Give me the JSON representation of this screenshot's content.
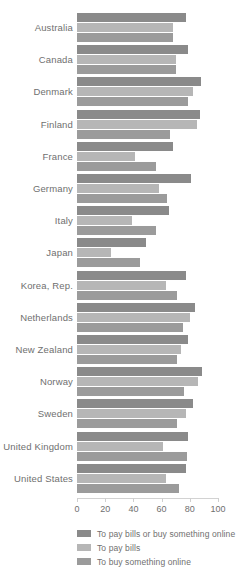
{
  "chart_data": {
    "type": "bar",
    "orientation": "horizontal",
    "title": "",
    "subtitle": "",
    "xlabel": "",
    "ylabel": "",
    "xlim": [
      0,
      100
    ],
    "xticks": [
      0,
      20,
      40,
      60,
      80,
      100
    ],
    "xtick_labels": [
      "0",
      "20",
      "40",
      "60",
      "80",
      "100"
    ],
    "grid": false,
    "legend_position": "bottom-left",
    "categories": [
      "Australia",
      "Canada",
      "Denmark",
      "Finland",
      "France",
      "Germany",
      "Italy",
      "Japan",
      "Korea, Rep.",
      "Netherlands",
      "New Zealand",
      "Norway",
      "Sweden",
      "United Kingdom",
      "United States"
    ],
    "series": [
      {
        "name": "To pay bills or buy something online",
        "color": "#8a8a8a",
        "values": [
          77,
          79,
          88,
          87,
          68,
          81,
          65,
          49,
          77,
          84,
          79,
          89,
          82,
          79,
          77
        ]
      },
      {
        "name": "To pay bills",
        "color": "#b6b6b6",
        "values": [
          68,
          70,
          82,
          85,
          41,
          58,
          39,
          24,
          63,
          80,
          74,
          86,
          77,
          61,
          63
        ]
      },
      {
        "name": "To buy something online",
        "color": "#9b9b9b",
        "values": [
          68,
          70,
          79,
          66,
          56,
          64,
          56,
          45,
          71,
          75,
          71,
          76,
          71,
          78,
          72
        ]
      }
    ]
  },
  "legend": {
    "items": [
      {
        "label": "To pay bills or buy something online",
        "color": "#8a8a8a"
      },
      {
        "label": "To pay bills",
        "color": "#b6b6b6"
      },
      {
        "label": "To buy something online",
        "color": "#9b9b9b"
      }
    ]
  },
  "colors": {
    "axis": "#d2d2d2",
    "tick": "#cfcfcf",
    "text": "#6f6f6f",
    "background": "#ffffff"
  }
}
